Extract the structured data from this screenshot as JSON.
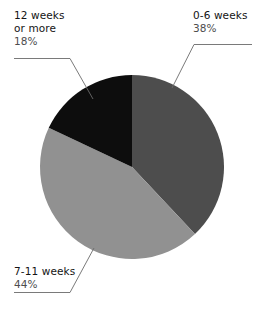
{
  "chart_data": {
    "type": "pie",
    "title": "",
    "subtitle": "",
    "xlabel": "",
    "ylabel": "",
    "legend_position": "none",
    "grid": false,
    "labels_format": "category + percent",
    "categories": [
      "0-6 weeks",
      "7-11 weeks",
      "12 weeks or more"
    ],
    "values": [
      38,
      44,
      18
    ],
    "value_unit": "%",
    "start_angle_deg": 0,
    "direction": "clockwise",
    "slices": [
      {
        "label": "0-6 weeks",
        "label_line1": "0-6 weeks",
        "label_line2": "38%",
        "value": 38,
        "percent_text": "38%",
        "color": "#4d4d4d",
        "start_angle_deg": 0,
        "end_angle_deg": 136.8,
        "callout_side": "top-right"
      },
      {
        "label": "7-11 weeks",
        "label_line1": "7-11 weeks",
        "label_line2": "44%",
        "value": 44,
        "percent_text": "44%",
        "color": "#919191",
        "start_angle_deg": 136.8,
        "end_angle_deg": 295.2,
        "callout_side": "bottom-left"
      },
      {
        "label": "12 weeks or more",
        "label_line1": "12 weeks",
        "label_line2": "or more",
        "label_line3": "18%",
        "value": 18,
        "percent_text": "18%",
        "color": "#0d0d0d",
        "start_angle_deg": 295.2,
        "end_angle_deg": 360,
        "callout_side": "top-left"
      }
    ],
    "geometry": {
      "center_x": 132,
      "center_y": 167,
      "radius": 92
    },
    "colors": {
      "background": "#ffffff",
      "slice_dark_gray": "#4d4d4d",
      "slice_light_gray": "#919191",
      "slice_black": "#0d0d0d",
      "leader_line": "#6b6b6b",
      "text": "#141414",
      "percent_text": "#4d4d4d"
    }
  }
}
